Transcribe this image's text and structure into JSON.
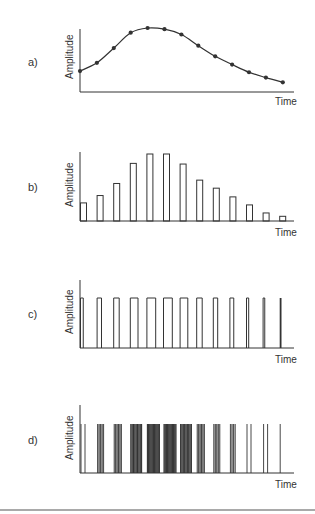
{
  "figure": {
    "stroke_color": "#333333",
    "background": "#ffffff",
    "bottom_rule": true
  },
  "panels": [
    {
      "id": "a",
      "label": "a)",
      "ylabel": "Amplitude",
      "xlabel": "Time",
      "kind": "continuous curve with sample dots"
    },
    {
      "id": "b",
      "label": "b)",
      "ylabel": "Amplitude",
      "xlabel": "Time",
      "kind": "pulse amplitude modulation"
    },
    {
      "id": "c",
      "label": "c)",
      "ylabel": "Amplitude",
      "xlabel": "Time",
      "kind": "pulse width modulation"
    },
    {
      "id": "d",
      "label": "d)",
      "ylabel": "Amplitude",
      "xlabel": "Time",
      "kind": "pulse code / density modulation"
    }
  ],
  "chart_data": [
    {
      "type": "line",
      "title": "a)",
      "xlabel": "Time",
      "ylabel": "Amplitude",
      "x": [
        1,
        2,
        3,
        4,
        5,
        6,
        7,
        8,
        9,
        10,
        11,
        12,
        13
      ],
      "values": [
        27,
        41,
        66,
        92,
        100,
        98,
        89,
        70,
        52,
        38,
        25,
        16,
        8
      ],
      "markers": true,
      "grid": false
    },
    {
      "type": "bar",
      "title": "b)",
      "xlabel": "Time",
      "ylabel": "Amplitude",
      "categories": [
        1,
        2,
        3,
        4,
        5,
        6,
        7,
        8,
        9,
        10,
        11,
        12,
        13
      ],
      "values": [
        27,
        38,
        56,
        86,
        100,
        100,
        85,
        61,
        49,
        36,
        24,
        12,
        7
      ],
      "grid": false
    },
    {
      "type": "bar",
      "title": "c)",
      "xlabel": "Time",
      "ylabel": "Amplitude",
      "description": "Constant-height pulses whose widths track the signal amplitude",
      "pulse_height": 100,
      "pulse_widths": [
        5,
        8,
        10,
        14,
        16,
        16,
        14,
        10,
        8,
        7,
        4,
        3,
        1.5
      ],
      "grid": false
    },
    {
      "type": "bar",
      "title": "d)",
      "xlabel": "Time",
      "ylabel": "Amplitude",
      "description": "Groups of constant-height narrow pulses whose density tracks the signal amplitude",
      "pulse_height": 100,
      "lines_per_group": [
        2,
        5,
        6,
        9,
        11,
        11,
        9,
        6,
        5,
        4,
        2,
        2,
        1
      ],
      "grid": false
    }
  ]
}
